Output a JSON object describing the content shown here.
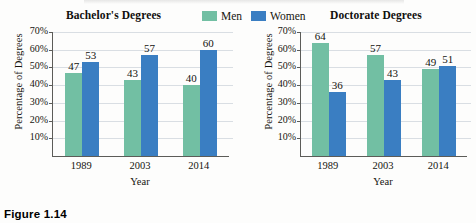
{
  "figure": {
    "caption": "Figure 1.14",
    "background_color": "#fdfdfc"
  },
  "legend": {
    "position": "top-center",
    "entries": [
      {
        "label": "Men",
        "color": "#72bfa3",
        "swatch_name": "legend-swatch-men"
      },
      {
        "label": "Women",
        "color": "#3a7ec2",
        "swatch_name": "legend-swatch-women"
      }
    ]
  },
  "colors": {
    "men": "#72bfa3",
    "women": "#3a7ec2",
    "gridline": "#d9dee3",
    "axis": "#5c5c58",
    "text": "#15140f"
  },
  "axis": {
    "ylabel": "Percentage of Degrees",
    "xlabel": "Year",
    "yticks": [
      "70%",
      "60%",
      "50%",
      "40%",
      "30%",
      "20%",
      "10%"
    ],
    "xticks": [
      "1989",
      "2003",
      "2014"
    ]
  },
  "chart_data": [
    {
      "type": "bar",
      "title": "Bachelor's Degrees",
      "categories": [
        "1989",
        "2003",
        "2014"
      ],
      "series": [
        {
          "name": "Men",
          "values": [
            47,
            43,
            40
          ],
          "color": "#72bfa3"
        },
        {
          "name": "Women",
          "values": [
            53,
            57,
            60
          ],
          "color": "#3a7ec2"
        }
      ],
      "xlabel": "Year",
      "ylabel": "Percentage of Degrees",
      "ylim": [
        0,
        70
      ],
      "ytick_values": [
        10,
        20,
        30,
        40,
        50,
        60,
        70
      ],
      "ytick_labels": [
        "10%",
        "20%",
        "30%",
        "40%",
        "50%",
        "60%",
        "70%"
      ],
      "grid": true,
      "legend": "top-center",
      "data_labels": true
    },
    {
      "type": "bar",
      "title": "Doctorate Degrees",
      "categories": [
        "1989",
        "2003",
        "2014"
      ],
      "series": [
        {
          "name": "Men",
          "values": [
            64,
            57,
            49
          ],
          "color": "#72bfa3"
        },
        {
          "name": "Women",
          "values": [
            36,
            43,
            51
          ],
          "color": "#3a7ec2"
        }
      ],
      "xlabel": "Year",
      "ylabel": "Percentage of Degrees",
      "ylim": [
        0,
        70
      ],
      "ytick_values": [
        10,
        20,
        30,
        40,
        50,
        60,
        70
      ],
      "ytick_labels": [
        "10%",
        "20%",
        "30%",
        "40%",
        "50%",
        "60%",
        "70%"
      ],
      "grid": true,
      "legend": "top-center",
      "data_labels": true
    }
  ]
}
